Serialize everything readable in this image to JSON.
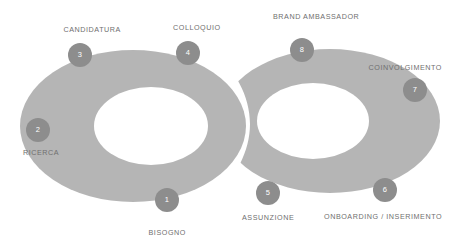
{
  "diagram": {
    "background_color": "#ffffff",
    "ring_color": "#b5b5b5",
    "node_color": "#8d8d8d",
    "node_text_color": "#ffffff",
    "label_color": "#6f6f6f",
    "nodes": [
      {
        "number": "1",
        "label": "BISOGNO",
        "cx": 167,
        "cy": 200,
        "label_x": 167,
        "label_y": 233,
        "label_position": "below"
      },
      {
        "number": "2",
        "label": "RICERCA",
        "cx": 38,
        "cy": 130,
        "label_x": 41,
        "label_y": 153,
        "label_position": "below"
      },
      {
        "number": "3",
        "label": "CANDIDATURA",
        "cx": 80,
        "cy": 55,
        "label_x": 92,
        "label_y": 30,
        "label_position": "above"
      },
      {
        "number": "4",
        "label": "COLLOQUIO",
        "cx": 188,
        "cy": 53,
        "label_x": 197,
        "label_y": 28,
        "label_position": "above"
      },
      {
        "number": "5",
        "label": "ASSUNZIONE",
        "cx": 268,
        "cy": 193,
        "label_x": 268,
        "label_y": 218,
        "label_position": "below"
      },
      {
        "number": "6",
        "label": "ONBOARDING / INSERIMENTO",
        "cx": 385,
        "cy": 190,
        "label_x": 383,
        "label_y": 217,
        "label_position": "below"
      },
      {
        "number": "7",
        "label": "COINVOLGIMENTO",
        "cx": 415,
        "cy": 90,
        "label_x": 405,
        "label_y": 68,
        "label_position": "above"
      },
      {
        "number": "8",
        "label": "BRAND AMBASSADOR",
        "cx": 302,
        "cy": 50,
        "label_x": 316,
        "label_y": 17,
        "label_position": "above"
      }
    ]
  }
}
